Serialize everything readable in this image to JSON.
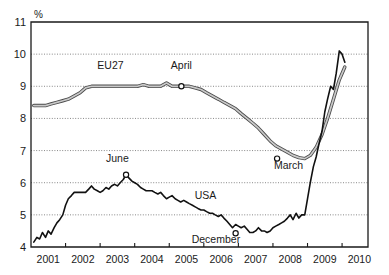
{
  "chart_data": {
    "type": "line",
    "title": "",
    "subtitle": "",
    "xlabel": "",
    "ylabel": "%",
    "unit_label": "%",
    "grid": true,
    "legend_position": "inline-annotations",
    "xlim": [
      2000.5,
      2010.25
    ],
    "ylim": [
      4,
      11
    ],
    "yticks": [
      4,
      5,
      6,
      7,
      8,
      9,
      10,
      11
    ],
    "ytick_labels": [
      "4",
      "5",
      "6",
      "7",
      "8",
      "9",
      "10",
      "11"
    ],
    "xticks": [
      2001,
      2002,
      2003,
      2004,
      2005,
      2006,
      2007,
      2008,
      2009,
      2010
    ],
    "xtick_labels": [
      "2001",
      "2002",
      "2003",
      "2004",
      "2005",
      "2006",
      "2007",
      "2008",
      "2009",
      "2010"
    ],
    "series": [
      {
        "name": "EU27",
        "color": "#b0b0b0",
        "style": "thick-gray-band",
        "x": [
          2000.58,
          2000.75,
          2000.92,
          2001.08,
          2001.25,
          2001.42,
          2001.58,
          2001.75,
          2001.92,
          2002.08,
          2002.25,
          2002.42,
          2002.58,
          2002.75,
          2002.92,
          2003.08,
          2003.25,
          2003.42,
          2003.58,
          2003.75,
          2003.92,
          2004.08,
          2004.25,
          2004.42,
          2004.58,
          2004.75,
          2004.92,
          2005.08,
          2005.25,
          2005.42,
          2005.58,
          2005.75,
          2005.92,
          2006.08,
          2006.25,
          2006.42,
          2006.58,
          2006.75,
          2006.92,
          2007.08,
          2007.25,
          2007.42,
          2007.58,
          2007.75,
          2007.92,
          2008.08,
          2008.25,
          2008.42,
          2008.58,
          2008.75,
          2008.92,
          2009.08,
          2009.25,
          2009.42,
          2009.58
        ],
        "y": [
          8.4,
          8.4,
          8.4,
          8.45,
          8.5,
          8.55,
          8.6,
          8.7,
          8.8,
          8.95,
          9.0,
          9.0,
          9.0,
          9.0,
          9.0,
          9.0,
          9.0,
          9.0,
          9.0,
          9.05,
          9.0,
          9.0,
          9.0,
          9.1,
          9.0,
          9.0,
          9.0,
          9.0,
          8.95,
          8.9,
          8.8,
          8.7,
          8.6,
          8.5,
          8.4,
          8.3,
          8.15,
          8.0,
          7.85,
          7.7,
          7.5,
          7.3,
          7.15,
          7.05,
          6.95,
          6.85,
          6.78,
          6.75,
          6.85,
          7.1,
          7.5,
          8.0,
          8.6,
          9.2,
          9.6
        ]
      },
      {
        "name": "USA",
        "color": "#111111",
        "style": "thin-black",
        "x": [
          2000.58,
          2000.67,
          2000.75,
          2000.83,
          2000.92,
          2001.0,
          2001.08,
          2001.17,
          2001.25,
          2001.33,
          2001.42,
          2001.5,
          2001.58,
          2001.67,
          2001.75,
          2001.83,
          2001.92,
          2002.0,
          2002.08,
          2002.17,
          2002.25,
          2002.33,
          2002.42,
          2002.5,
          2002.58,
          2002.67,
          2002.75,
          2002.83,
          2002.92,
          2003.0,
          2003.08,
          2003.17,
          2003.25,
          2003.33,
          2003.42,
          2003.5,
          2003.58,
          2003.67,
          2003.75,
          2003.83,
          2003.92,
          2004.0,
          2004.08,
          2004.17,
          2004.25,
          2004.33,
          2004.42,
          2004.5,
          2004.58,
          2004.67,
          2004.75,
          2004.83,
          2004.92,
          2005.0,
          2005.08,
          2005.17,
          2005.25,
          2005.33,
          2005.42,
          2005.5,
          2005.58,
          2005.67,
          2005.75,
          2005.83,
          2005.92,
          2006.0,
          2006.08,
          2006.17,
          2006.25,
          2006.33,
          2006.42,
          2006.5,
          2006.58,
          2006.67,
          2006.75,
          2006.83,
          2006.92,
          2007.0,
          2007.08,
          2007.17,
          2007.25,
          2007.33,
          2007.42,
          2007.5,
          2007.58,
          2007.67,
          2007.75,
          2007.83,
          2007.92,
          2008.0,
          2008.08,
          2008.17,
          2008.25,
          2008.33,
          2008.42,
          2008.5,
          2008.58,
          2008.67,
          2008.75,
          2008.83,
          2008.92,
          2009.0,
          2009.08,
          2009.17,
          2009.25,
          2009.33,
          2009.42,
          2009.5,
          2009.58
        ],
        "y": [
          4.15,
          4.3,
          4.25,
          4.45,
          4.3,
          4.5,
          4.4,
          4.6,
          4.75,
          4.85,
          5.0,
          5.3,
          5.5,
          5.6,
          5.7,
          5.7,
          5.7,
          5.7,
          5.7,
          5.8,
          5.9,
          5.8,
          5.75,
          5.7,
          5.75,
          5.85,
          5.8,
          5.9,
          5.95,
          5.9,
          6.0,
          6.1,
          6.25,
          6.15,
          6.05,
          6.0,
          5.95,
          5.85,
          5.8,
          5.75,
          5.75,
          5.75,
          5.7,
          5.65,
          5.7,
          5.6,
          5.5,
          5.55,
          5.6,
          5.5,
          5.45,
          5.4,
          5.45,
          5.4,
          5.35,
          5.3,
          5.25,
          5.2,
          5.15,
          5.15,
          5.1,
          5.05,
          5.05,
          5.0,
          4.95,
          5.0,
          4.9,
          4.8,
          4.7,
          4.6,
          4.7,
          4.65,
          4.6,
          4.65,
          4.55,
          4.45,
          4.45,
          4.5,
          4.6,
          4.5,
          4.5,
          4.45,
          4.5,
          4.6,
          4.65,
          4.7,
          4.75,
          4.8,
          4.9,
          5.0,
          4.85,
          5.05,
          4.9,
          5.0,
          5.0,
          5.5,
          6.0,
          6.5,
          6.8,
          7.2,
          7.6,
          8.2,
          8.6,
          9.0,
          8.9,
          9.4,
          10.1,
          10.0,
          9.75
        ]
      }
    ],
    "annotations": [
      {
        "text": "EU27",
        "series": "EU27",
        "x": 2002.8,
        "y": 9.55,
        "marker": false
      },
      {
        "text": "April",
        "series": "EU27",
        "x": 2004.85,
        "y": 9.55,
        "marker": true,
        "marker_x": 2004.85,
        "marker_y": 9.0
      },
      {
        "text": "March",
        "series": "EU27",
        "x": 2007.95,
        "y": 6.42,
        "marker": true,
        "marker_x": 2007.62,
        "marker_y": 6.75
      },
      {
        "text": "June",
        "series": "USA",
        "x": 2003.0,
        "y": 6.63,
        "marker": true,
        "marker_x": 2003.25,
        "marker_y": 6.25
      },
      {
        "text": "USA",
        "series": "USA",
        "x": 2005.55,
        "y": 5.5,
        "marker": false
      },
      {
        "text": "December",
        "series": "USA",
        "x": 2005.85,
        "y": 4.13,
        "marker": true,
        "marker_x": 2006.42,
        "marker_y": 4.43
      }
    ]
  }
}
